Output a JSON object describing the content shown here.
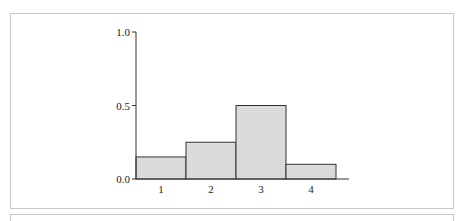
{
  "chart_data": {
    "type": "bar",
    "title": "",
    "xlabel": "",
    "ylabel": "",
    "categories": [
      "1",
      "2",
      "3",
      "4"
    ],
    "values": [
      0.15,
      0.25,
      0.5,
      0.1
    ],
    "ylim": [
      0,
      1.0
    ],
    "yticks": [
      "0.0",
      "0.5",
      "1.0"
    ],
    "xticks": [
      "1",
      "2",
      "3",
      "4"
    ],
    "grid": false,
    "legend": null,
    "bar_fill": "#dcdcdc",
    "bar_stroke": "#333333",
    "axis_color": "#333333"
  }
}
